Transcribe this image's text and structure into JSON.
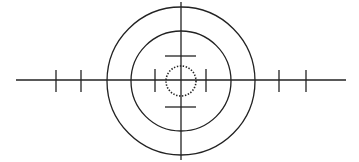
{
  "diagram": {
    "type": "crosshair-reticle",
    "width": 359,
    "height": 162,
    "stroke_color": "#222222",
    "background": "#ffffff",
    "center": {
      "x": 181,
      "y": 81
    },
    "horizontal_line": {
      "x1": 16,
      "x2": 346,
      "y": 80
    },
    "vertical_line": {
      "x": 181,
      "y1": 2,
      "y2": 160
    },
    "outer_circle": {
      "r": 74
    },
    "inner_circle": {
      "r": 50
    },
    "dotted_circle": {
      "r": 15
    },
    "top_bar": {
      "x1": 165,
      "x2": 196,
      "y": 56
    },
    "bottom_bar": {
      "x1": 165,
      "x2": 196,
      "y": 107
    },
    "ticks": [
      {
        "name": "outer-left-tick",
        "x": 56,
        "y1": 70,
        "y2": 92
      },
      {
        "name": "mid-left-tick",
        "x": 81,
        "y1": 70,
        "y2": 92
      },
      {
        "name": "inner-left-tick",
        "x": 155,
        "y1": 69,
        "y2": 92
      },
      {
        "name": "inner-right-tick",
        "x": 206,
        "y1": 69,
        "y2": 92
      },
      {
        "name": "mid-right-tick",
        "x": 279,
        "y1": 70,
        "y2": 92
      },
      {
        "name": "outer-right-tick",
        "x": 306,
        "y1": 70,
        "y2": 92
      }
    ]
  }
}
